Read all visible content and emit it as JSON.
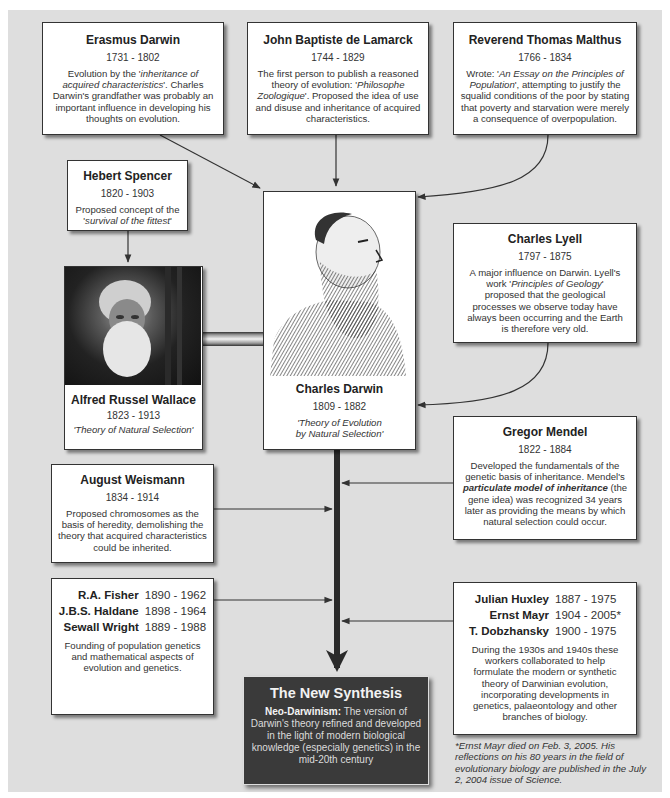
{
  "diagram": {
    "colors": {
      "panel": "#dedede",
      "box": "#ffffff",
      "border": "#333333",
      "synthesis_bg": "#3a3a3a",
      "trunk": "#2a2a2a"
    }
  },
  "erasmus": {
    "name": "Erasmus Darwin",
    "dates": "1731 - 1802",
    "desc_pre": "Evolution by the '",
    "desc_em": "inheritance of acquired characteristics",
    "desc_post": "'. Charles Darwin's grandfather was probably an important influence in developing his thoughts on evolution."
  },
  "lamarck": {
    "name": "John Baptiste de Lamarck",
    "dates": "1744 - 1829",
    "desc_pre": "The first person to publish a reasoned theory of evolution: '",
    "desc_em": "Philosophe Zoologique",
    "desc_post": "'. Proposed the idea of use and disuse and inheritance of acquired characteristics."
  },
  "malthus": {
    "name": "Reverend Thomas Malthus",
    "dates": "1766 - 1834",
    "desc_pre": "Wrote: '",
    "desc_em": "An Essay on the Principles of Population",
    "desc_post": "', attempting to justify the squalid conditions of the poor by stating that poverty and starvation were merely a consequence of overpopulation."
  },
  "spencer": {
    "name": "Hebert Spencer",
    "dates": "1820 - 1903",
    "desc_pre": "Proposed concept of the '",
    "desc_em": "survival of the fittest",
    "desc_post": "'"
  },
  "wallace": {
    "name": "Alfred Russel Wallace",
    "dates": "1823 - 1913",
    "theory": "'Theory of Natural Selection'",
    "portrait": "wallace-photo"
  },
  "darwin": {
    "name": "Charles Darwin",
    "dates": "1809 - 1882",
    "theory_line1": "'Theory of Evolution",
    "theory_line2": "by Natural Selection'",
    "portrait": "darwin-engraving"
  },
  "lyell": {
    "name": "Charles Lyell",
    "dates": "1797 - 1875",
    "desc_pre": "A major influence on Darwin. Lyell's work '",
    "desc_em": "Principles of Geology",
    "desc_post": "' proposed that the geological processes we observe today have always been occurring and the Earth is therefore very old."
  },
  "mendel": {
    "name": "Gregor Mendel",
    "dates": "1822 - 1884",
    "desc_pre": "Developed the fundamentals of the genetic basis of inheritance. Mendel's ",
    "desc_em": "particulate model of inheritance",
    "desc_post": " (the gene idea) was recognized 34 years later as providing the means by which natural selection could occur."
  },
  "weismann": {
    "name": "August Weismann",
    "dates": "1834 - 1914",
    "desc": "Proposed chromosomes as the basis of heredity, demolishing the theory that acquired characteristics could be inherited."
  },
  "geneticists": {
    "people": [
      {
        "name": "R.A. Fisher",
        "dates": "1890 - 1962"
      },
      {
        "name": "J.B.S. Haldane",
        "dates": "1898 - 1964"
      },
      {
        "name": "Sewall Wright",
        "dates": "1889 - 1988"
      }
    ],
    "desc": "Founding of population genetics and mathematical aspects of evolution and genetics."
  },
  "synthesists": {
    "people": [
      {
        "name": "Julian Huxley",
        "dates": "1887 - 1975"
      },
      {
        "name": "Ernst Mayr",
        "dates": "1904 - 2005*"
      },
      {
        "name": "T. Dobzhansky",
        "dates": "1900 - 1975"
      }
    ],
    "desc": "During the 1930s and 1940s these workers collaborated to help formulate the modern or synthetic theory of Darwinian evolution, incorporating developments in genetics, palaeontology and other branches of biology."
  },
  "synthesis": {
    "title": "The New Synthesis",
    "lead": "Neo-Darwinism:",
    "body": " The version of Darwin's theory refined and developed in the light of modern biological knowledge (especially genetics) in the mid-20th century"
  },
  "footnote": "*Ernst Mayr died on Feb. 3, 2005. His reflections on his 80 years in the field of evolutionary biology are published in the July 2, 2004 issue of Science."
}
